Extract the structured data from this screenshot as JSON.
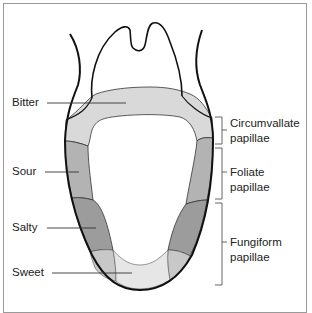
{
  "diagram": {
    "taste_labels": [
      {
        "id": "bitter",
        "label": "Bitter"
      },
      {
        "id": "sour",
        "label": "Sour"
      },
      {
        "id": "salty",
        "label": "Salty"
      },
      {
        "id": "sweet",
        "label": "Sweet"
      }
    ],
    "papillae_labels": [
      {
        "id": "circumvallate",
        "line1": "Circumvallate",
        "line2": "papillae"
      },
      {
        "id": "foliate",
        "line1": "Foliate",
        "line2": "papillae"
      },
      {
        "id": "fungiform",
        "line1": "Fungiform",
        "line2": "papillae"
      }
    ],
    "colors": {
      "bitter": "#d9d9d9",
      "sour": "#b3b3b3",
      "salty": "#9c9c9c",
      "sweet_side": "#c8c8c8",
      "sweet_tip": "#e6e6e6",
      "outline": "#111111",
      "frame": "#9a9a9a"
    }
  }
}
